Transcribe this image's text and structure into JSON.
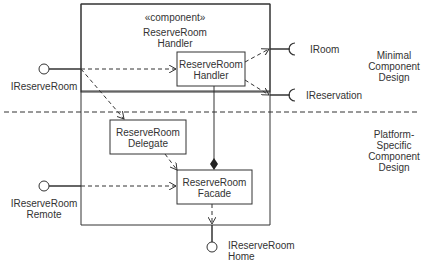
{
  "component": {
    "stereotype": "«component»",
    "name_line1": "ReserveRoom",
    "name_line2": "Handler"
  },
  "parts": {
    "handler": {
      "line1": "ReserveRoom",
      "line2": "Handler"
    },
    "delegate": {
      "line1": "ReserveRoom",
      "line2": "Delegate"
    },
    "facade": {
      "line1": "ReserveRoom",
      "line2": "Facade"
    }
  },
  "provided_interfaces": {
    "ireserveroom": "IReserveRoom",
    "remote_line1": "IReserveRoom",
    "remote_line2": "Remote",
    "home_line1": "IReserveRoom",
    "home_line2": "Home"
  },
  "required_interfaces": {
    "iroom": "IRoom",
    "ireservation": "IReservation"
  },
  "regions": {
    "minimal": {
      "line1": "Minimal",
      "line2": "Component",
      "line3": "Design"
    },
    "platform": {
      "line1": "Platform-",
      "line2": "Specific",
      "line3": "Component",
      "line4": "Design"
    }
  }
}
